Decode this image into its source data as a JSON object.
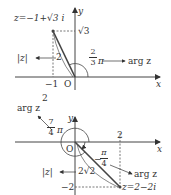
{
  "diagram1": {
    "point_label": "z=−1+√3 i",
    "y_tick_label": "√3",
    "x_tick_label": "−1",
    "origin_label": "O",
    "x_axis_label": "x",
    "y_axis_label": "y",
    "modulus_label": "|z|",
    "modulus_value": "2",
    "angle_num": "2",
    "angle_den": "3",
    "angle_pi": "π",
    "arg_label": "arg z"
  },
  "diagram2": {
    "stray_label": "2",
    "arg_label_top": "arg z",
    "angle1_num": "7",
    "angle1_den": "4",
    "angle1_pi": "π",
    "origin_label": "O",
    "x_axis_label": "x",
    "y_axis_label": "y",
    "x_tick_label": "2",
    "angle2_num": "π",
    "angle2_den": "4",
    "angle2_sign": "−",
    "arg_label_right": "arg z",
    "modulus_label": "|z|",
    "modulus_value": "2√2",
    "y_tick_label": "−2",
    "point_label": "z=2−2i"
  },
  "colors": {
    "line": "#444444",
    "text": "#333333"
  }
}
